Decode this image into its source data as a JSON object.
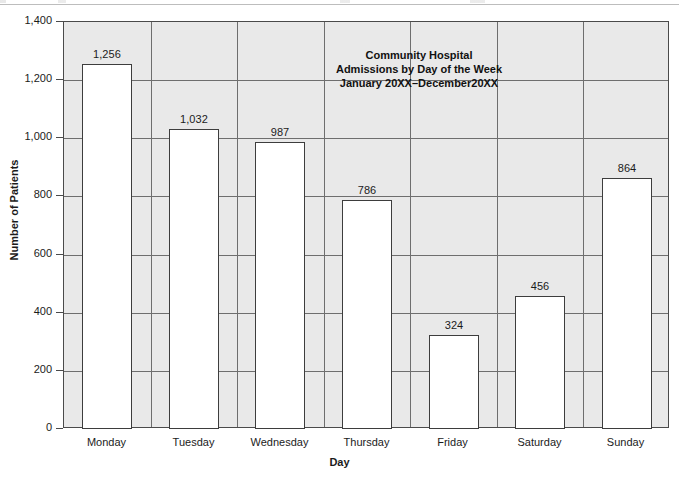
{
  "chart_data": {
    "type": "bar",
    "title": "Community Hospital Admissions by Day of the Week January 20XX–December20XX",
    "title_lines": [
      "Community Hospital",
      "Admissions by Day of the Week",
      "January 20XX–December20XX"
    ],
    "categories": [
      "Monday",
      "Tuesday",
      "Wednesday",
      "Thursday",
      "Friday",
      "Saturday",
      "Sunday"
    ],
    "values": [
      1256,
      1032,
      987,
      786,
      324,
      456,
      864
    ],
    "value_labels": [
      "1,256",
      "1,032",
      "987",
      "786",
      "324",
      "456",
      "864"
    ],
    "xlabel": "Day",
    "ylabel": "Number of Patients",
    "ylim": [
      0,
      1400
    ],
    "ytick_values": [
      0,
      200,
      400,
      600,
      800,
      1000,
      1200,
      1400
    ],
    "ytick_labels": [
      "0",
      "200",
      "400",
      "600",
      "800",
      "1,000",
      "1,200",
      "1,400"
    ],
    "grid": "horizontal",
    "legend": "none",
    "colors": {
      "bar_fill": "#ffffff",
      "bar_stroke": "#3d3d3d",
      "plot_background": "#e9e9e9",
      "gridline": "#6e6e6e",
      "axis": "#4a4a4a",
      "text": "#1b1b1b"
    }
  }
}
